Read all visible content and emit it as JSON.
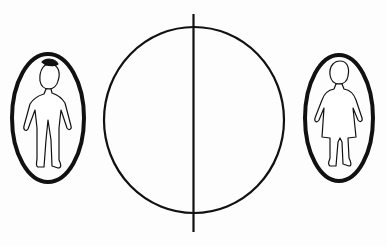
{
  "diagram": {
    "stroke_color": "#111111",
    "background": "#fdfdfd",
    "elements": [
      {
        "id": "left-figure",
        "label": "male-figure",
        "container": "oval"
      },
      {
        "id": "center-circle",
        "label": "circle-divided",
        "divider": "vertical-line"
      },
      {
        "id": "right-figure",
        "label": "female-figure",
        "container": "oval"
      }
    ]
  }
}
